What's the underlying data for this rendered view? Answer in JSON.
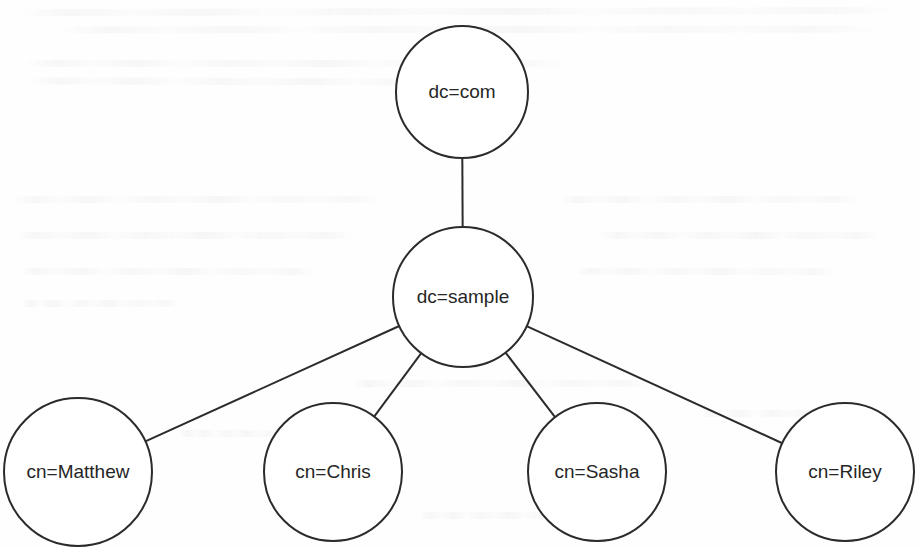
{
  "diagram": {
    "type": "tree-graph",
    "canvas": {
      "width": 921,
      "height": 548,
      "background": "#fefefe"
    },
    "style": {
      "node_shape": "circle",
      "node_fill": "#ffffff",
      "node_stroke": "#2b2b2b",
      "node_stroke_width": 2,
      "edge_stroke": "#2b2b2b",
      "edge_stroke_width": 2,
      "label_color": "#262626",
      "label_font_size": 19
    },
    "nodes": [
      {
        "id": "root",
        "label": "dc=com",
        "cx": 462,
        "cy": 92,
        "r": 66,
        "level": 0
      },
      {
        "id": "sample",
        "label": "dc=sample",
        "cx": 463,
        "cy": 297,
        "r": 70,
        "level": 1
      },
      {
        "id": "matthew",
        "label": "cn=Matthew",
        "cx": 78,
        "cy": 472,
        "r": 74,
        "level": 2
      },
      {
        "id": "chris",
        "label": "cn=Chris",
        "cx": 333,
        "cy": 472,
        "r": 69,
        "level": 2
      },
      {
        "id": "sasha",
        "label": "cn=Sasha",
        "cx": 597,
        "cy": 472,
        "r": 69,
        "level": 2
      },
      {
        "id": "riley",
        "label": "cn=Riley",
        "cx": 845,
        "cy": 472,
        "r": 69,
        "level": 2
      }
    ],
    "edges": [
      {
        "id": "edge-root-sample",
        "from": "root",
        "to": "sample"
      },
      {
        "id": "edge-sample-matthew",
        "from": "sample",
        "to": "matthew"
      },
      {
        "id": "edge-sample-chris",
        "from": "sample",
        "to": "chris"
      },
      {
        "id": "edge-sample-sasha",
        "from": "sample",
        "to": "sasha"
      },
      {
        "id": "edge-sample-riley",
        "from": "sample",
        "to": "riley"
      }
    ]
  },
  "background": {
    "description": "faint scanned-page bleed-through ghosting, illegible",
    "ghost_lines": [
      {
        "x": 18,
        "y": 8,
        "w": 880
      },
      {
        "x": 60,
        "y": 26,
        "w": 820
      },
      {
        "x": 24,
        "y": 60,
        "w": 540
      },
      {
        "x": 30,
        "y": 78,
        "w": 500
      },
      {
        "x": 12,
        "y": 196,
        "w": 370
      },
      {
        "x": 16,
        "y": 232,
        "w": 340
      },
      {
        "x": 18,
        "y": 268,
        "w": 300
      },
      {
        "x": 20,
        "y": 300,
        "w": 160
      },
      {
        "x": 560,
        "y": 196,
        "w": 300
      },
      {
        "x": 600,
        "y": 232,
        "w": 280
      },
      {
        "x": 575,
        "y": 268,
        "w": 260
      },
      {
        "x": 350,
        "y": 380,
        "w": 300
      },
      {
        "x": 700,
        "y": 410,
        "w": 190
      },
      {
        "x": 180,
        "y": 430,
        "w": 120
      },
      {
        "x": 420,
        "y": 512,
        "w": 160
      }
    ]
  }
}
